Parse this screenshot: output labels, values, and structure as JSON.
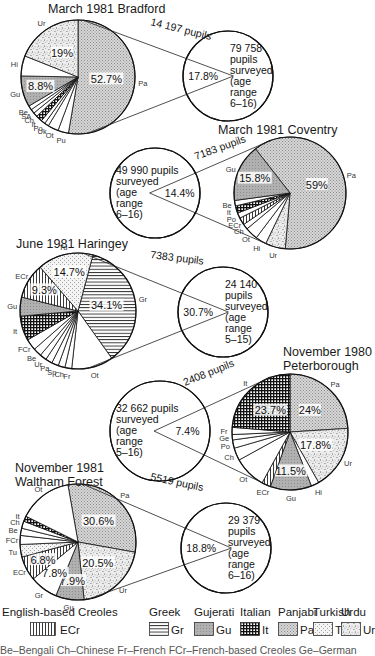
{
  "chart_data": [
    {
      "type": "pie",
      "title": "March 1981 Bradford",
      "connector_label": "14 197 pupils",
      "summary_circle": {
        "share": "17.8%",
        "text": [
          "79 758",
          "pupils",
          "surveyed",
          "(age",
          "range",
          "6–16)"
        ]
      },
      "slices": [
        {
          "label": "Pa",
          "value": 52.7,
          "pattern": "Pa",
          "shown": "52.7%"
        },
        {
          "label": "Pu",
          "value": 3.0,
          "pattern": "none"
        },
        {
          "label": "Ot",
          "value": 3.0,
          "pattern": "none"
        },
        {
          "label": "Uk",
          "value": 1.2,
          "pattern": "none"
        },
        {
          "label": "Po",
          "value": 1.2,
          "pattern": "none"
        },
        {
          "label": "It",
          "value": 1.8,
          "pattern": "It"
        },
        {
          "label": "Ch",
          "value": 1.2,
          "pattern": "none"
        },
        {
          "label": "SA",
          "value": 1.2,
          "pattern": "none"
        },
        {
          "label": "Be",
          "value": 1.2,
          "pattern": "none"
        },
        {
          "label": "Gu",
          "value": 8.8,
          "pattern": "Gu",
          "shown": "8.8%"
        },
        {
          "label": "Hi",
          "value": 5.7,
          "pattern": "none"
        },
        {
          "label": "Ur",
          "value": 19.0,
          "pattern": "Ur",
          "shown": "19%"
        }
      ]
    },
    {
      "type": "pie",
      "title": "March 1981 Coventry",
      "connector_label": "7183 pupils",
      "summary_circle": {
        "share": "14.4%",
        "text": [
          "49 990 pupils",
          "surveyed",
          "(age",
          "range",
          "6–16)"
        ]
      },
      "slices": [
        {
          "label": "Pa",
          "value": 59.0,
          "pattern": "Pa",
          "shown": "59%"
        },
        {
          "label": "Ur",
          "value": 5.5,
          "pattern": "Ur"
        },
        {
          "label": "Hi",
          "value": 3.0,
          "pattern": "none"
        },
        {
          "label": "Ot",
          "value": 3.5,
          "pattern": "none"
        },
        {
          "label": "Ch",
          "value": 1.5,
          "pattern": "none"
        },
        {
          "label": "ECr",
          "value": 2.0,
          "pattern": "ECr"
        },
        {
          "label": "Po",
          "value": 1.5,
          "pattern": "none"
        },
        {
          "label": "It",
          "value": 2.0,
          "pattern": "It"
        },
        {
          "label": "Be",
          "value": 1.5,
          "pattern": "none"
        },
        {
          "label": "Gu",
          "value": 15.8,
          "pattern": "Gu",
          "shown": "15.8%"
        }
      ]
    },
    {
      "type": "pie",
      "title": "June 1981 Haringey",
      "connector_label": "7383 pupils",
      "summary_circle": {
        "share": "30.7%",
        "text": [
          "24 140",
          "pupils",
          "surveyed",
          "(age",
          "range",
          "5–15)"
        ]
      },
      "slices": [
        {
          "label": "Gr",
          "value": 34.1,
          "pattern": "Gr",
          "shown": "34.1%"
        },
        {
          "label": "Ot",
          "value": 11.0,
          "pattern": "none"
        },
        {
          "label": "Fr",
          "value": 1.8,
          "pattern": "none"
        },
        {
          "label": "Ch",
          "value": 1.8,
          "pattern": "none"
        },
        {
          "label": "Sp",
          "value": 1.8,
          "pattern": "none"
        },
        {
          "label": "Pa",
          "value": 1.8,
          "pattern": "none"
        },
        {
          "label": "Ur",
          "value": 1.8,
          "pattern": "none"
        },
        {
          "label": "Be",
          "value": 2.2,
          "pattern": "none"
        },
        {
          "label": "FCr",
          "value": 3.0,
          "pattern": "none"
        },
        {
          "label": "It",
          "value": 6.5,
          "pattern": "It"
        },
        {
          "label": "Gu",
          "value": 5.0,
          "pattern": "Gu"
        },
        {
          "label": "ECr",
          "value": 9.3,
          "pattern": "ECr",
          "shown": "9.3%"
        },
        {
          "label": "Tu",
          "value": 14.7,
          "pattern": "Tu",
          "shown": "14.7%"
        }
      ]
    },
    {
      "type": "pie",
      "title": "November 1980 Peterborough",
      "connector_label": "2408 pupils",
      "summary_circle": {
        "share": "7.4%",
        "text": [
          "32 662 pupils",
          "surveyed",
          "(age",
          "range",
          "5–16)"
        ]
      },
      "slices": [
        {
          "label": "Pa",
          "value": 24.0,
          "pattern": "Pa",
          "shown": "24%"
        },
        {
          "label": "Ur",
          "value": 17.8,
          "pattern": "Ur",
          "shown": "17.8%"
        },
        {
          "label": "Hi",
          "value": 2.2,
          "pattern": "none"
        },
        {
          "label": "Gu",
          "value": 11.5,
          "pattern": "Gu",
          "shown": "11.5%"
        },
        {
          "label": "ECr",
          "value": 2.5,
          "pattern": "ECr"
        },
        {
          "label": "Ot",
          "value": 9.0,
          "pattern": "none"
        },
        {
          "label": "Ch",
          "value": 3.5,
          "pattern": "none"
        },
        {
          "label": "Po",
          "value": 2.3,
          "pattern": "none"
        },
        {
          "label": "Ge",
          "value": 1.5,
          "pattern": "none"
        },
        {
          "label": "Fr",
          "value": 2.0,
          "pattern": "none"
        },
        {
          "label": "It",
          "value": 23.7,
          "pattern": "It",
          "shown": "23.7%"
        }
      ]
    },
    {
      "type": "pie",
      "title": "November 1981 Waltham Forest",
      "connector_label": "5519 pupils",
      "summary_circle": {
        "share": "18.8%",
        "text": [
          "29 379",
          "pupils",
          "surveyed",
          "(age",
          "range",
          "6–16)"
        ]
      },
      "slices": [
        {
          "label": "Pa",
          "value": 30.6,
          "pattern": "Pa",
          "shown": "30.6%"
        },
        {
          "label": "Ur",
          "value": 20.5,
          "pattern": "Ur",
          "shown": "20.5%"
        },
        {
          "label": "Gu",
          "value": 7.9,
          "pattern": "Gu",
          "shown": "7.9%"
        },
        {
          "label": "Gr",
          "value": 7.8,
          "pattern": "none",
          "shown": "7.8%"
        },
        {
          "label": "ECr",
          "value": 6.8,
          "pattern": "ECr",
          "shown": "6.8%"
        },
        {
          "label": "Tu",
          "value": 3.5,
          "pattern": "Tu"
        },
        {
          "label": "FCr",
          "value": 2.5,
          "pattern": "none"
        },
        {
          "label": "Be",
          "value": 2.0,
          "pattern": "none"
        },
        {
          "label": "Ch",
          "value": 2.0,
          "pattern": "none"
        },
        {
          "label": "It",
          "value": 1.5,
          "pattern": "It"
        },
        {
          "label": "Ot",
          "value": 14.9,
          "pattern": "none"
        }
      ]
    }
  ],
  "legend": {
    "items": [
      {
        "name": "English-based Creoles",
        "code": "ECr"
      },
      {
        "name": "Greek",
        "code": "Gr"
      },
      {
        "name": "Gujerati",
        "code": "Gu"
      },
      {
        "name": "Italian",
        "code": "It"
      },
      {
        "name": "Panjabi",
        "code": "Pa"
      },
      {
        "name": "Turkish",
        "code": "Tu"
      },
      {
        "name": "Urdu",
        "code": "Ur"
      }
    ],
    "footer": "Be–Bengali   Ch–Chinese   Fr–French   FCr–French-based Creoles   Ge–German"
  }
}
